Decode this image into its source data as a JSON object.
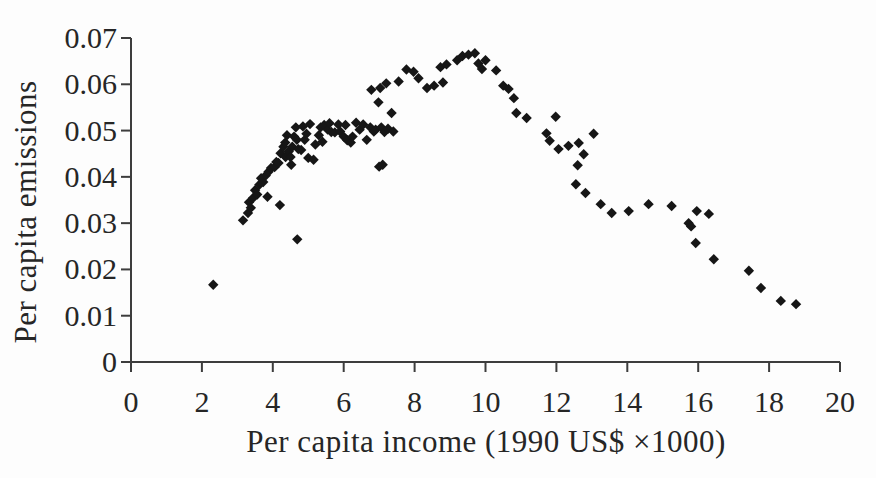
{
  "chart_data": {
    "type": "scatter",
    "title": "",
    "xlabel": "Per capita income (1990 US$ ×1000)",
    "ylabel": "Per capita emissions",
    "xlim": [
      0,
      20
    ],
    "ylim": [
      0,
      0.07
    ],
    "x_ticks": [
      0,
      2,
      4,
      6,
      8,
      10,
      12,
      14,
      16,
      18,
      20
    ],
    "x_tick_labels": [
      "0",
      "2",
      "4",
      "6",
      "8",
      "10",
      "12",
      "14",
      "16",
      "18",
      "20"
    ],
    "y_ticks": [
      0,
      0.01,
      0.02,
      0.03,
      0.04,
      0.05,
      0.06,
      0.07
    ],
    "y_tick_labels": [
      "0",
      "0.01",
      "0.02",
      "0.03",
      "0.04",
      "0.05",
      "0.06",
      "0.07"
    ],
    "grid": false,
    "legend": "none",
    "marker": {
      "shape": "diamond",
      "color": "#161616",
      "size_px": 10.4
    },
    "axis_color": "#3d3d3d",
    "text_color": "#262626",
    "series": [
      {
        "name": "per-capita-emissions-vs-income",
        "points": [
          [
            2.32,
            0.0167
          ],
          [
            3.16,
            0.0306
          ],
          [
            3.3,
            0.0322
          ],
          [
            3.33,
            0.0345
          ],
          [
            3.38,
            0.0333
          ],
          [
            3.45,
            0.0355
          ],
          [
            3.5,
            0.0371
          ],
          [
            3.56,
            0.0362
          ],
          [
            3.62,
            0.0383
          ],
          [
            3.67,
            0.0397
          ],
          [
            3.73,
            0.0389
          ],
          [
            3.8,
            0.0403
          ],
          [
            3.85,
            0.0357
          ],
          [
            3.88,
            0.0411
          ],
          [
            3.95,
            0.0419
          ],
          [
            4.05,
            0.0421
          ],
          [
            4.1,
            0.0432
          ],
          [
            4.16,
            0.043
          ],
          [
            4.2,
            0.0339
          ],
          [
            4.22,
            0.0451
          ],
          [
            4.3,
            0.0465
          ],
          [
            4.35,
            0.0474
          ],
          [
            4.36,
            0.0443
          ],
          [
            4.4,
            0.049
          ],
          [
            4.45,
            0.0455
          ],
          [
            4.5,
            0.0443
          ],
          [
            4.52,
            0.0426
          ],
          [
            4.55,
            0.0465
          ],
          [
            4.6,
            0.0487
          ],
          [
            4.65,
            0.0507
          ],
          [
            4.68,
            0.048
          ],
          [
            4.69,
            0.0265
          ],
          [
            4.72,
            0.046
          ],
          [
            4.8,
            0.0458
          ],
          [
            4.85,
            0.0509
          ],
          [
            4.9,
            0.048
          ],
          [
            4.95,
            0.0493
          ],
          [
            5.0,
            0.0441
          ],
          [
            5.05,
            0.0514
          ],
          [
            5.15,
            0.0437
          ],
          [
            5.2,
            0.047
          ],
          [
            5.3,
            0.049
          ],
          [
            5.35,
            0.0507
          ],
          [
            5.4,
            0.0476
          ],
          [
            5.45,
            0.0512
          ],
          [
            5.55,
            0.0502
          ],
          [
            5.6,
            0.0516
          ],
          [
            5.65,
            0.0497
          ],
          [
            5.75,
            0.0496
          ],
          [
            5.85,
            0.0513
          ],
          [
            5.9,
            0.0498
          ],
          [
            6.0,
            0.0487
          ],
          [
            6.05,
            0.0512
          ],
          [
            6.1,
            0.0479
          ],
          [
            6.2,
            0.0474
          ],
          [
            6.25,
            0.0487
          ],
          [
            6.35,
            0.0517
          ],
          [
            6.45,
            0.0502
          ],
          [
            6.55,
            0.0513
          ],
          [
            6.65,
            0.048
          ],
          [
            6.75,
            0.0507
          ],
          [
            6.78,
            0.0588
          ],
          [
            6.85,
            0.0498
          ],
          [
            6.9,
            0.0502
          ],
          [
            6.98,
            0.0561
          ],
          [
            7.0,
            0.0422
          ],
          [
            7.03,
            0.0592
          ],
          [
            7.06,
            0.0507
          ],
          [
            7.1,
            0.0426
          ],
          [
            7.15,
            0.0497
          ],
          [
            7.2,
            0.0602
          ],
          [
            7.25,
            0.0504
          ],
          [
            7.35,
            0.0538
          ],
          [
            7.4,
            0.0498
          ],
          [
            7.55,
            0.0606
          ],
          [
            7.77,
            0.0632
          ],
          [
            7.97,
            0.0627
          ],
          [
            8.11,
            0.0613
          ],
          [
            8.35,
            0.0592
          ],
          [
            8.55,
            0.0597
          ],
          [
            8.73,
            0.0637
          ],
          [
            8.8,
            0.0604
          ],
          [
            8.9,
            0.0643
          ],
          [
            9.2,
            0.0652
          ],
          [
            9.35,
            0.0661
          ],
          [
            9.52,
            0.0664
          ],
          [
            9.7,
            0.0667
          ],
          [
            9.8,
            0.0645
          ],
          [
            9.9,
            0.0633
          ],
          [
            10.0,
            0.0652
          ],
          [
            10.3,
            0.063
          ],
          [
            10.5,
            0.0597
          ],
          [
            10.65,
            0.059
          ],
          [
            10.8,
            0.057
          ],
          [
            10.87,
            0.0538
          ],
          [
            11.16,
            0.0527
          ],
          [
            11.72,
            0.0494
          ],
          [
            11.81,
            0.0478
          ],
          [
            11.98,
            0.053
          ],
          [
            12.06,
            0.046
          ],
          [
            12.34,
            0.0467
          ],
          [
            12.55,
            0.0384
          ],
          [
            12.6,
            0.0425
          ],
          [
            12.63,
            0.0473
          ],
          [
            12.77,
            0.0449
          ],
          [
            12.82,
            0.0365
          ],
          [
            13.05,
            0.0493
          ],
          [
            13.25,
            0.0341
          ],
          [
            13.56,
            0.0322
          ],
          [
            14.04,
            0.0326
          ],
          [
            14.6,
            0.0341
          ],
          [
            15.25,
            0.0337
          ],
          [
            15.73,
            0.03
          ],
          [
            15.8,
            0.0293
          ],
          [
            15.93,
            0.0257
          ],
          [
            15.96,
            0.0326
          ],
          [
            16.3,
            0.032
          ],
          [
            16.44,
            0.0222
          ],
          [
            17.43,
            0.0197
          ],
          [
            17.77,
            0.016
          ],
          [
            18.33,
            0.0132
          ],
          [
            18.76,
            0.0125
          ]
        ]
      }
    ]
  }
}
